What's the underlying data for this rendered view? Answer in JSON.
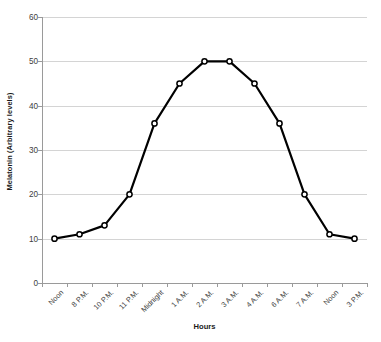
{
  "chart_data": {
    "type": "line",
    "title": "",
    "xlabel": "Hours",
    "ylabel": "Melatonin (Arbitrary levels)",
    "categories": [
      "Noon",
      "8 P.M.",
      "10 P.M.",
      "11 P.M.",
      "Midnight",
      "1 A.M.",
      "2 A.M.",
      "3 A.M.",
      "4 A.M.",
      "6 A.M.",
      "7 A.M.",
      "Noon",
      "3 P.M."
    ],
    "values": [
      10,
      11,
      13,
      20,
      36,
      45,
      50,
      50,
      45,
      36,
      20,
      11,
      10
    ],
    "ylim": [
      0,
      60
    ],
    "yticks": [
      0,
      10,
      20,
      30,
      40,
      50,
      60
    ],
    "ytick_labels": [
      "0",
      "10",
      "20",
      "30",
      "40",
      "50",
      "60"
    ],
    "grid": true,
    "legend": false,
    "legend_position": "none",
    "series_color": "#000000",
    "gridline_color": "#d4d4d4",
    "axis_color": "#9a9a9a",
    "marker": "circle-open",
    "marker_fill": "#ffffff",
    "background": "#ffffff"
  }
}
